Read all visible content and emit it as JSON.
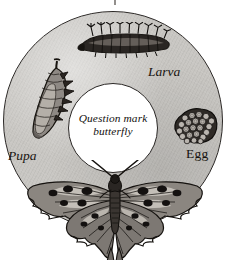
{
  "diagram": {
    "type": "life-cycle-ring",
    "subject": "Question mark butterfly",
    "center_caption_line1": "Question mark",
    "center_caption_line2": "butterfly",
    "stages": [
      {
        "id": "larva",
        "label": "Larva",
        "icon": "caterpillar-icon",
        "position": "top"
      },
      {
        "id": "egg",
        "label": "Egg",
        "icon": "egg-cluster-icon",
        "position": "right"
      },
      {
        "id": "butterfly",
        "label": "",
        "icon": "butterfly-icon",
        "position": "bottom"
      },
      {
        "id": "pupa",
        "label": "Pupa",
        "icon": "chrysalis-icon",
        "position": "left"
      }
    ],
    "colors": {
      "ring_fill": "#c9c7c3",
      "ring_outline": "#2b2826",
      "center_fill": "#ffffff",
      "ink": "#17130f",
      "page_background": "#ffffff"
    }
  }
}
